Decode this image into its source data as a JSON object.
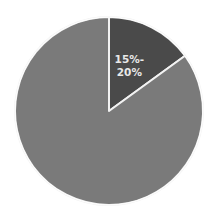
{
  "chart_data": {
    "type": "pie",
    "title": "",
    "start_angle": "12 o'clock",
    "direction": "clockwise",
    "legend": "none",
    "slices": [
      {
        "label": "15%-20%",
        "label_lines": [
          "15%-",
          "20%"
        ],
        "value": 15,
        "color": "#4a4a4a",
        "show_label": true
      },
      {
        "label": "",
        "label_lines": [],
        "value": 85,
        "color": "#7a7a7a",
        "show_label": false
      }
    ],
    "separator_color": "#f2f2f2",
    "label_color": "#e8e8e8"
  }
}
